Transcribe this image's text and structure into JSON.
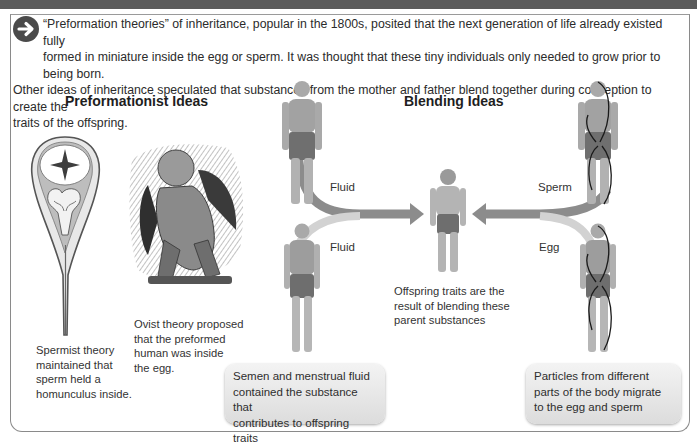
{
  "intro": {
    "icon": "arrow-right-circle-icon",
    "line1": "“Preformation theories” of inheritance, popular in the 1800s, posited that the next generation of life already existed fully",
    "line2": "formed in miniature inside the egg or sperm. It was thought that these tiny individuals only needed to grow prior to being born.",
    "line3": "Other ideas of inheritance speculated that substances from the mother and father blend together during conception to create the",
    "line4": "traits of the offspring."
  },
  "preformationist": {
    "heading": "Preformationist Ideas",
    "spermist_caption": [
      "Spermist theory",
      "maintained that",
      "sperm held a",
      "homunculus inside."
    ],
    "ovist_caption": [
      "Ovist theory proposed",
      "that the preformed",
      "human was inside",
      "the egg."
    ]
  },
  "blending": {
    "heading": "Blending Ideas",
    "labels": {
      "fluid_male": "Fluid",
      "fluid_female": "Fluid",
      "sperm": "Sperm",
      "egg": "Egg"
    },
    "offspring_caption": [
      "Offspring traits are the",
      "result of blending these",
      "parent substances"
    ],
    "left_callout": [
      "Semen and menstrual fluid",
      "contained the substance that",
      "contributes to offspring traits"
    ],
    "right_callout": [
      "Particles from different",
      "parts of the body migrate",
      "to the egg and sperm"
    ]
  },
  "colors": {
    "topbar": "#5b5b5b",
    "frame": "#8a8a8a",
    "arrow_dark": "#7a7a7a",
    "arrow_light": "#c9c9c9",
    "callout_bg": "#e6e6e6"
  }
}
